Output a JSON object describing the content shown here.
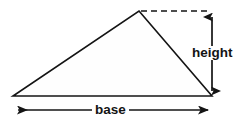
{
  "figure": {
    "background_color": "#ffffff",
    "stroke_color": "#141414",
    "fill_color": "#fefefe",
    "labels": {
      "base": "base",
      "height": "height"
    },
    "shape": {
      "name": "triangle",
      "vertices": [
        {
          "name": "apex",
          "x": 139,
          "y": 11
        },
        {
          "name": "bottom-right",
          "x": 212,
          "y": 96
        },
        {
          "name": "bottom-left",
          "x": 13,
          "y": 96
        }
      ]
    },
    "annotations": {
      "dashed_guide": {
        "name": "apex-horizontal-guide",
        "x1": 141,
        "y1": 11,
        "x2": 211,
        "y2": 11,
        "style": "dashed"
      },
      "height_arrow": {
        "name": "height-dimension-arrow",
        "x1": 212,
        "y1": 12,
        "x2": 212,
        "y2": 96,
        "arrowheads": "both",
        "orientation": "vertical"
      },
      "base_arrow": {
        "name": "base-dimension-arrow",
        "x1": 11,
        "y1": 110,
        "x2": 215,
        "y2": 110,
        "arrowheads": "both",
        "orientation": "horizontal"
      }
    }
  }
}
